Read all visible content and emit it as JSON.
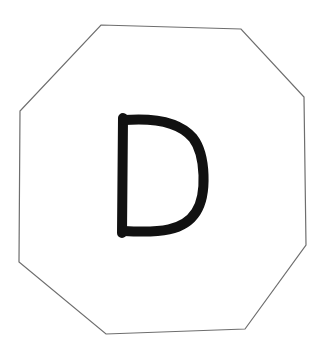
{
  "diagram": {
    "background": "#ffffff",
    "shape": {
      "type": "octagon",
      "stroke": "#6e6e6e",
      "stroke_width": 1.2,
      "fill": "#ffffff",
      "points": "101,25 241,29 304,97 306,245 245,329 106,334 19,262 20,111"
    },
    "glyph": {
      "letter": "D",
      "stroke": "#111111",
      "stroke_width": 10,
      "stem_path": "M123,118 L122,233",
      "bowl_path": "M124,120 C150,118 178,120 193,138 C206,155 207,195 196,212 C184,231 160,233 124,231"
    }
  }
}
